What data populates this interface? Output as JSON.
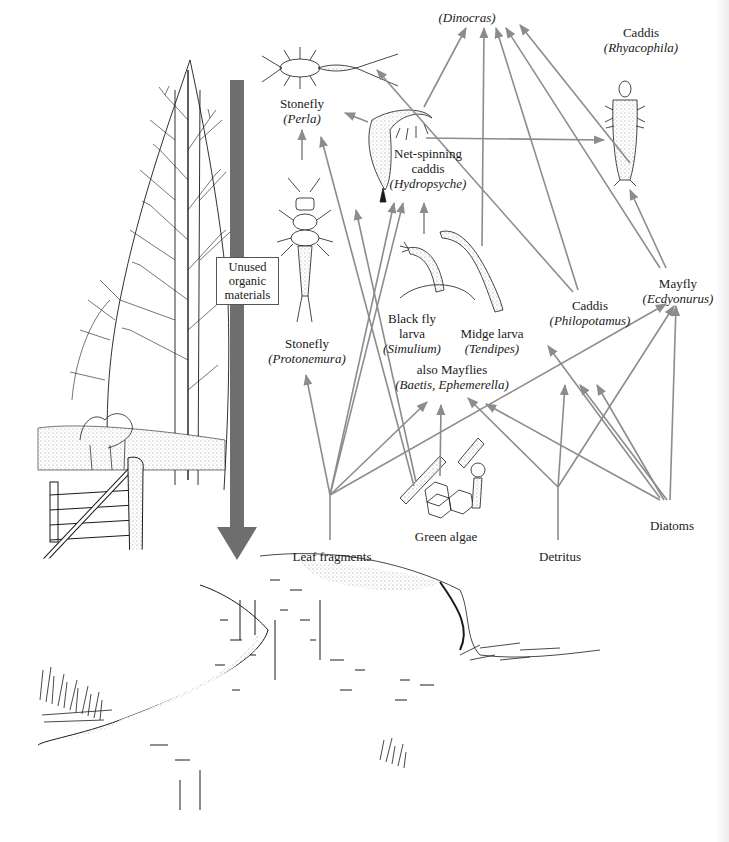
{
  "diagram": {
    "title": "",
    "colors": {
      "arrow": "#8c8c8c",
      "big_arrow": "#6e6e6e",
      "ink": "#1a1a1a",
      "background": "#ffffff"
    },
    "big_arrow": {
      "label_lines": [
        "Unused",
        "organic",
        "materials"
      ]
    },
    "nodes": {
      "dinocras": {
        "name": "",
        "genus": "(Dinocras)",
        "x": 467,
        "y": 10
      },
      "rhyacophila": {
        "name": "Caddis",
        "genus": "(Rhyacophila)",
        "x": 652,
        "y": 25
      },
      "perla": {
        "name": "Stonefly",
        "genus": "(Perla)",
        "x": 302,
        "y": 96
      },
      "hydropsyche": {
        "name_lines": [
          "Net-spinning",
          "caddis"
        ],
        "genus": "(Hydropsyche)",
        "x": 428,
        "y": 146
      },
      "protonemura": {
        "name": "Stonefly",
        "genus": "(Protonemura)",
        "x": 307,
        "y": 336
      },
      "simulium": {
        "name_lines": [
          "Black fly",
          "larva"
        ],
        "genus": "(Simulium)",
        "x": 420,
        "y": 311
      },
      "tendipes": {
        "name": "Midge larva",
        "genus": "(Tendipes)",
        "x": 500,
        "y": 326
      },
      "also_mayflies": {
        "name": "also Mayflies",
        "genus": "(Baetis, Ephemerella)",
        "x": 452,
        "y": 360
      },
      "philopotamus": {
        "name": "Caddis",
        "genus": "(Philopotamus)",
        "x": 590,
        "y": 296
      },
      "ecdyonurus": {
        "name": "Mayfly",
        "genus": "(Ecdyonurus)",
        "x": 685,
        "y": 276
      },
      "leaf": {
        "name": "Leaf fragments",
        "x": 330,
        "y": 549
      },
      "green_algae": {
        "name": "Green algae",
        "x": 446,
        "y": 529
      },
      "detritus": {
        "name": "Detritus",
        "x": 558,
        "y": 549
      },
      "diatoms": {
        "name": "Diatoms",
        "x": 670,
        "y": 518
      }
    },
    "edges": [
      {
        "from": "hydropsyche",
        "to": "perla"
      },
      {
        "from": "hydropsyche",
        "to": "dinocras"
      },
      {
        "from": "hydropsyche",
        "to": "rhyacophila"
      },
      {
        "from": "protonemura",
        "to": "perla"
      },
      {
        "from": "simulium",
        "to": "hydropsyche"
      },
      {
        "from": "tendipes",
        "to": "dinocras"
      },
      {
        "from": "philopotamus",
        "to": "dinocras"
      },
      {
        "from": "philopotamus",
        "to": "perla"
      },
      {
        "from": "ecdyonurus",
        "to": "dinocras"
      },
      {
        "from": "ecdyonurus",
        "to": "rhyacophila"
      },
      {
        "from": "leaf",
        "to": "protonemura"
      },
      {
        "from": "leaf",
        "to": "hydropsyche"
      },
      {
        "from": "leaf",
        "to": "also_mayflies"
      },
      {
        "from": "leaf",
        "to": "ecdyonurus"
      },
      {
        "from": "green_algae",
        "to": "perla"
      },
      {
        "from": "green_algae",
        "to": "also_mayflies"
      },
      {
        "from": "green_algae",
        "to": "hydropsyche"
      },
      {
        "from": "detritus",
        "to": "philopotamus"
      },
      {
        "from": "detritus",
        "to": "ecdyonurus"
      },
      {
        "from": "diatoms",
        "to": "also_mayflies"
      },
      {
        "from": "diatoms",
        "to": "philopotamus"
      },
      {
        "from": "diatoms",
        "to": "ecdyonurus"
      },
      {
        "from": "diatoms",
        "to": "hydropsyche"
      }
    ]
  }
}
